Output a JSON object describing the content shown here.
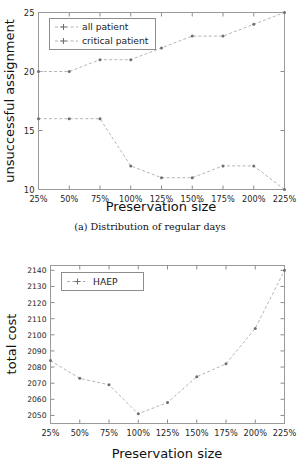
{
  "chart_data": [
    {
      "id": "chart-a",
      "type": "line",
      "title": "",
      "caption": "(a) Distribution of regular days",
      "xlabel": "Preservation size",
      "ylabel": "unsuccessful assignment",
      "categories": [
        "25%",
        "50%",
        "75%",
        "100%",
        "125%",
        "150%",
        "175%",
        "200%",
        "225%"
      ],
      "ylim": [
        10,
        25
      ],
      "yticks": [
        10,
        15,
        20,
        25
      ],
      "yticklabels": [
        "10",
        "15",
        "20",
        "25"
      ],
      "grid": false,
      "legend_position": "top-left",
      "series": [
        {
          "name": "all patient",
          "values": [
            16,
            16,
            16,
            12,
            11,
            11,
            12,
            12,
            10
          ]
        },
        {
          "name": "critical patient",
          "values": [
            20,
            20,
            21,
            21,
            22,
            23,
            23,
            24,
            25
          ]
        }
      ]
    },
    {
      "id": "chart-b",
      "type": "line",
      "title": "",
      "caption": "",
      "xlabel": "Preservation size",
      "ylabel": "total cost",
      "categories": [
        "25%",
        "50%",
        "75%",
        "100%",
        "125%",
        "150%",
        "175%",
        "200%",
        "225%"
      ],
      "ylim": [
        2045,
        2143
      ],
      "yticks": [
        2050,
        2060,
        2070,
        2080,
        2090,
        2100,
        2110,
        2120,
        2130,
        2140
      ],
      "yticklabels": [
        "2050",
        "2060",
        "2070",
        "2080",
        "2090",
        "2100",
        "2110",
        "2120",
        "2130",
        "2140"
      ],
      "grid": false,
      "legend_position": "top-left",
      "series": [
        {
          "name": "HAEP",
          "values": [
            2084,
            2073,
            2069,
            2051,
            2058,
            2074,
            2082,
            2104,
            2140
          ]
        }
      ]
    }
  ],
  "figure_a": {
    "ylabel": "unsuccessful assignment",
    "xlabel": "Preservation size",
    "caption": "(a) Distribution of regular days",
    "legend": {
      "items": [
        {
          "label": "all patient"
        },
        {
          "label": "critical patient"
        }
      ]
    },
    "xticklabels": [
      "25%",
      "50%",
      "75%",
      "100%",
      "125%",
      "150%",
      "175%",
      "200%",
      "225%"
    ],
    "yticklabels": [
      "10",
      "15",
      "20",
      "25"
    ]
  },
  "figure_b": {
    "ylabel": "total cost",
    "xlabel": "Preservation size",
    "legend": {
      "items": [
        {
          "label": "HAEP"
        }
      ]
    },
    "xticklabels": [
      "25%",
      "50%",
      "75%",
      "100%",
      "125%",
      "150%",
      "175%",
      "200%",
      "225%"
    ],
    "yticklabels": [
      "2050",
      "2060",
      "2070",
      "2080",
      "2090",
      "2100",
      "2110",
      "2120",
      "2130",
      "2140"
    ]
  },
  "colors": {
    "line": "#b5b5b5",
    "marker": "#6f6f6f",
    "frame": "#9a9a9a",
    "text": "#1a1a1a",
    "background": "#ffffff"
  }
}
